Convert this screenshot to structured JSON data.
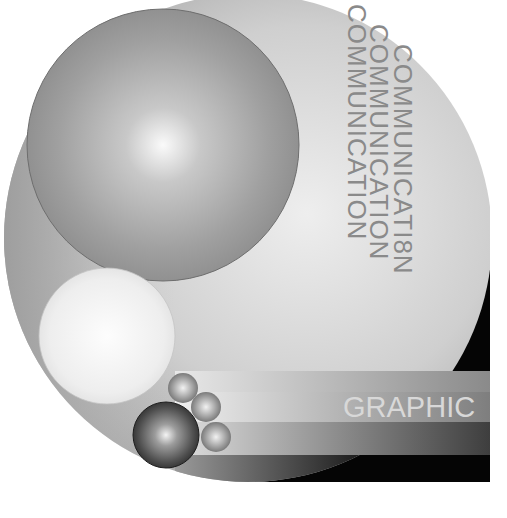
{
  "artwork": {
    "title_text_columns": [
      {
        "text": "COMMUNICATION",
        "x": 348,
        "y": 4
      },
      {
        "text": "COMMUNICATION",
        "x": 370,
        "y": 24
      },
      {
        "text": "COMMUNICATI8N",
        "x": 392,
        "y": 44
      }
    ],
    "label": "GRAPHIC",
    "colors": {
      "background": "#ffffff",
      "disc_light": "#e6e6e6",
      "disc_dark": "#9a9a9a",
      "corner_black": "#050505",
      "text_gray": "#8a8a8a",
      "label_light": "#d8d8d8"
    },
    "stripes": [
      {
        "y": 371,
        "h": 21,
        "from": "#e8e8e8",
        "to": "#8a8a8a"
      },
      {
        "y": 392,
        "h": 30,
        "from": "#f0f0f0",
        "to": "#7e7e7e"
      },
      {
        "y": 422,
        "h": 33,
        "from": "#e0e0e0",
        "to": "#3e3e3e"
      },
      {
        "y": 455,
        "h": 27,
        "from": "#9a9a9a",
        "to": "#050505"
      }
    ]
  }
}
